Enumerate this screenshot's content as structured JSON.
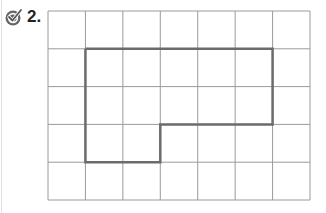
{
  "problem": {
    "number": "2.",
    "icon": "check-circle-icon"
  },
  "grid": {
    "columns": 7,
    "rows": 5,
    "origin_x": 48,
    "origin_y": 11,
    "cell_w": 37.43,
    "cell_h": 37.8,
    "line_color": "#9a9a9a",
    "shape_color": "#6b6b6b",
    "shape_outline": [
      [
        1,
        1
      ],
      [
        6,
        1
      ],
      [
        6,
        3
      ],
      [
        3,
        3
      ],
      [
        3,
        4
      ],
      [
        1,
        4
      ],
      [
        1,
        1
      ]
    ]
  }
}
